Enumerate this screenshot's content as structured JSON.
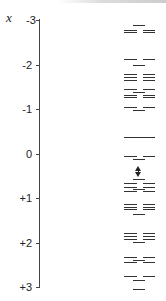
{
  "diagram": {
    "axis_variable": "x",
    "ticks": [
      {
        "label": "-3",
        "value": -3
      },
      {
        "label": "-2",
        "value": -2
      },
      {
        "label": "-1",
        "value": -1
      },
      {
        "label": "0",
        "value": 0
      },
      {
        "label": "+1",
        "value": 1
      },
      {
        "label": "+2",
        "value": 2
      },
      {
        "label": "+3",
        "value": 3
      }
    ],
    "levels": [
      {
        "x": -2.88,
        "type": "center"
      },
      {
        "x": -2.78,
        "type": "split"
      },
      {
        "x": -2.72,
        "type": "split"
      },
      {
        "x": -2.12,
        "type": "split"
      },
      {
        "x": -1.98,
        "type": "center"
      },
      {
        "x": -1.78,
        "type": "split"
      },
      {
        "x": -1.72,
        "type": "split"
      },
      {
        "x": -1.66,
        "type": "split"
      },
      {
        "x": -1.45,
        "type": "split"
      },
      {
        "x": -1.38,
        "type": "center"
      },
      {
        "x": -1.32,
        "type": "split"
      },
      {
        "x": -1.28,
        "type": "split"
      },
      {
        "x": -1.05,
        "type": "split"
      },
      {
        "x": -0.98,
        "type": "center"
      },
      {
        "x": -0.38,
        "type": "full"
      },
      {
        "x": 0.06,
        "type": "split"
      },
      {
        "x": 0.12,
        "type": "center"
      },
      {
        "x": 0.58,
        "type": "center"
      },
      {
        "x": 0.67,
        "type": "split"
      },
      {
        "x": 0.76,
        "type": "split"
      },
      {
        "x": 0.8,
        "type": "center"
      },
      {
        "x": 0.84,
        "type": "split"
      },
      {
        "x": 1.13,
        "type": "split"
      },
      {
        "x": 1.2,
        "type": "split"
      },
      {
        "x": 1.24,
        "type": "split"
      },
      {
        "x": 1.36,
        "type": "center"
      },
      {
        "x": 1.78,
        "type": "split"
      },
      {
        "x": 1.86,
        "type": "split"
      },
      {
        "x": 1.92,
        "type": "split"
      },
      {
        "x": 1.98,
        "type": "center"
      },
      {
        "x": 2.33,
        "type": "split"
      },
      {
        "x": 2.4,
        "type": "center"
      },
      {
        "x": 2.43,
        "type": "split"
      },
      {
        "x": 2.76,
        "type": "split"
      },
      {
        "x": 2.84,
        "type": "center"
      },
      {
        "x": 3.05,
        "type": "center"
      }
    ],
    "gap_arrow": {
      "from": 0.28,
      "to": 0.53,
      "style": "double-headed"
    }
  }
}
